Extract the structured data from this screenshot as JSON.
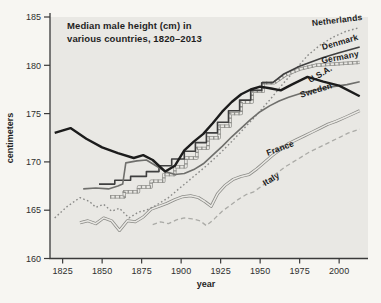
{
  "chart": {
    "title_line1": "Median male height (cm) in",
    "title_line2": "various countries, 1820–2013",
    "y_axis": {
      "label": "centimeters",
      "tick_labels": [
        "185",
        "180",
        "175",
        "170",
        "165",
        "160"
      ]
    },
    "x_axis": {
      "label": "year",
      "tick_labels": [
        "1825",
        "1850",
        "1875",
        "1900",
        "1925",
        "1950",
        "1975",
        "2000"
      ]
    }
  },
  "chart_data": {
    "type": "line",
    "title": "Median male height (cm) in various countries, 1820–2013",
    "xlabel": "year",
    "ylabel": "centimeters",
    "xlim": [
      1817,
      2017
    ],
    "ylim": [
      160,
      185
    ],
    "x_ticks": [
      1825,
      1850,
      1875,
      1900,
      1925,
      1950,
      1975,
      2000
    ],
    "y_ticks": [
      185,
      180,
      175,
      170,
      165,
      160
    ],
    "grid": false,
    "legend": "inline-labels-at-line-ends",
    "layout": {
      "x0": 50,
      "x1": 366,
      "y0": 258.5,
      "y1": 17,
      "xmin": 1817,
      "xmax": 2017,
      "ymin": 160,
      "ymax": 185
    },
    "colors": {
      "page_bg": "#f7f6f2",
      "plot_bg": "#e9e8e4",
      "axis": "#3a3a3a",
      "text": "#1f1f1f"
    },
    "series": [
      {
        "name": "italy",
        "label": "Italy",
        "line_style": "dashed",
        "color": "#ababa7",
        "points": [
          [
            1882,
            163.5
          ],
          [
            1887,
            163.8
          ],
          [
            1892,
            163.6
          ],
          [
            1897,
            164.0
          ],
          [
            1902,
            164.2
          ],
          [
            1907,
            164.1
          ],
          [
            1912,
            163.9
          ],
          [
            1916,
            163.4
          ],
          [
            1921,
            164.1
          ],
          [
            1926,
            164.9
          ],
          [
            1931,
            165.5
          ],
          [
            1936,
            166.1
          ],
          [
            1941,
            166.6
          ],
          [
            1946,
            166.9
          ],
          [
            1951,
            167.5
          ],
          [
            1956,
            168.2
          ],
          [
            1961,
            168.9
          ],
          [
            1966,
            169.5
          ],
          [
            1971,
            170.0
          ],
          [
            1976,
            170.5
          ],
          [
            1981,
            171.0
          ],
          [
            1986,
            171.4
          ],
          [
            1991,
            171.8
          ],
          [
            1996,
            172.2
          ],
          [
            2001,
            172.6
          ],
          [
            2006,
            173.0
          ],
          [
            2013,
            173.4
          ]
        ]
      },
      {
        "name": "france",
        "label": "France",
        "line_style": "double",
        "color": "#8a8a86",
        "points": [
          [
            1836,
            163.7
          ],
          [
            1841,
            163.9
          ],
          [
            1846,
            163.6
          ],
          [
            1851,
            164.2
          ],
          [
            1856,
            163.9
          ],
          [
            1861,
            162.9
          ],
          [
            1866,
            163.9
          ],
          [
            1871,
            163.8
          ],
          [
            1876,
            164.3
          ],
          [
            1881,
            165.1
          ],
          [
            1886,
            165.4
          ],
          [
            1891,
            165.7
          ],
          [
            1896,
            166.1
          ],
          [
            1901,
            166.4
          ],
          [
            1906,
            166.5
          ],
          [
            1911,
            166.3
          ],
          [
            1915,
            165.9
          ],
          [
            1919,
            165.4
          ],
          [
            1923,
            166.7
          ],
          [
            1928,
            167.6
          ],
          [
            1933,
            168.2
          ],
          [
            1938,
            168.5
          ],
          [
            1943,
            168.7
          ],
          [
            1948,
            169.3
          ],
          [
            1953,
            170.0
          ],
          [
            1958,
            170.7
          ],
          [
            1963,
            171.3
          ],
          [
            1968,
            171.9
          ],
          [
            1973,
            172.3
          ],
          [
            1978,
            172.7
          ],
          [
            1983,
            173.1
          ],
          [
            1988,
            173.5
          ],
          [
            1993,
            173.9
          ],
          [
            1998,
            174.2
          ],
          [
            2005,
            174.7
          ],
          [
            2013,
            175.3
          ]
        ]
      },
      {
        "name": "netherlands",
        "label": "Netherlands",
        "line_style": "dotted",
        "color": "#8a8a88",
        "points": [
          [
            1820,
            164.2
          ],
          [
            1828,
            165.4
          ],
          [
            1836,
            166.3
          ],
          [
            1842,
            165.9
          ],
          [
            1846,
            165.3
          ],
          [
            1851,
            165.6
          ],
          [
            1856,
            164.9
          ],
          [
            1861,
            165.2
          ],
          [
            1867,
            164.2
          ],
          [
            1873,
            164.8
          ],
          [
            1878,
            165.0
          ],
          [
            1884,
            165.5
          ],
          [
            1892,
            166.3
          ],
          [
            1900,
            167.4
          ],
          [
            1908,
            168.5
          ],
          [
            1916,
            169.6
          ],
          [
            1924,
            170.8
          ],
          [
            1932,
            172.1
          ],
          [
            1940,
            173.5
          ],
          [
            1948,
            174.9
          ],
          [
            1956,
            176.4
          ],
          [
            1964,
            178.0
          ],
          [
            1972,
            179.5
          ],
          [
            1980,
            181.0
          ],
          [
            1988,
            182.1
          ],
          [
            1996,
            182.9
          ],
          [
            2004,
            183.5
          ],
          [
            2013,
            183.9
          ]
        ]
      },
      {
        "name": "germany",
        "label": "Germany",
        "line_style": "railroad",
        "color": "#90908c",
        "points": [
          [
            1855,
            166.4
          ],
          [
            1864,
            166.4
          ],
          [
            1864,
            166.9
          ],
          [
            1873,
            166.9
          ],
          [
            1873,
            167.4
          ],
          [
            1881,
            167.4
          ],
          [
            1881,
            168.0
          ],
          [
            1889,
            168.0
          ],
          [
            1889,
            168.7
          ],
          [
            1896,
            168.7
          ],
          [
            1896,
            169.5
          ],
          [
            1903,
            169.5
          ],
          [
            1903,
            170.4
          ],
          [
            1910,
            170.4
          ],
          [
            1910,
            171.4
          ],
          [
            1917,
            171.4
          ],
          [
            1917,
            172.5
          ],
          [
            1924,
            172.5
          ],
          [
            1924,
            173.7
          ],
          [
            1931,
            173.7
          ],
          [
            1931,
            175.0
          ],
          [
            1938,
            175.0
          ],
          [
            1938,
            176.2
          ],
          [
            1945,
            176.2
          ],
          [
            1945,
            177.3
          ],
          [
            1952,
            177.3
          ],
          [
            1952,
            178.2
          ],
          [
            1959,
            178.2
          ],
          [
            1966,
            179.0
          ],
          [
            1975,
            179.6
          ],
          [
            1985,
            180.0
          ],
          [
            2013,
            180.3
          ]
        ]
      },
      {
        "name": "denmark",
        "label": "Denmark",
        "line_style": "solid",
        "color": "#3f3f3f",
        "points": [
          [
            1848,
            167.7
          ],
          [
            1858,
            167.7
          ],
          [
            1858,
            168.1
          ],
          [
            1868,
            168.1
          ],
          [
            1868,
            168.5
          ],
          [
            1878,
            168.5
          ],
          [
            1878,
            169.0
          ],
          [
            1886,
            169.0
          ],
          [
            1886,
            169.6
          ],
          [
            1894,
            169.6
          ],
          [
            1894,
            170.3
          ],
          [
            1902,
            170.3
          ],
          [
            1902,
            171.1
          ],
          [
            1909,
            171.1
          ],
          [
            1909,
            172.0
          ],
          [
            1916,
            172.0
          ],
          [
            1916,
            173.0
          ],
          [
            1923,
            173.0
          ],
          [
            1923,
            174.1
          ],
          [
            1930,
            174.1
          ],
          [
            1930,
            175.3
          ],
          [
            1937,
            175.3
          ],
          [
            1937,
            176.4
          ],
          [
            1944,
            176.4
          ],
          [
            1944,
            177.4
          ],
          [
            1951,
            177.4
          ],
          [
            1951,
            178.2
          ],
          [
            1958,
            178.2
          ],
          [
            1965,
            179.1
          ],
          [
            1975,
            179.9
          ],
          [
            1990,
            180.8
          ],
          [
            2000,
            181.3
          ],
          [
            2013,
            181.9
          ]
        ]
      },
      {
        "name": "sweden",
        "label": "Sweden",
        "line_style": "solid",
        "color": "#6f6f6c",
        "points": [
          [
            1838,
            167.2
          ],
          [
            1846,
            167.3
          ],
          [
            1854,
            167.2
          ],
          [
            1860,
            167.5
          ],
          [
            1863,
            167.7
          ],
          [
            1865,
            169.9
          ],
          [
            1872,
            170.1
          ],
          [
            1878,
            170.2
          ],
          [
            1884,
            169.6
          ],
          [
            1890,
            169.0
          ],
          [
            1896,
            168.7
          ],
          [
            1902,
            168.8
          ],
          [
            1908,
            169.2
          ],
          [
            1914,
            169.8
          ],
          [
            1920,
            170.7
          ],
          [
            1926,
            171.6
          ],
          [
            1932,
            172.6
          ],
          [
            1938,
            173.5
          ],
          [
            1944,
            174.4
          ],
          [
            1950,
            175.2
          ],
          [
            1956,
            175.8
          ],
          [
            1962,
            176.3
          ],
          [
            1968,
            176.7
          ],
          [
            1976,
            177.1
          ],
          [
            1986,
            177.5
          ],
          [
            1996,
            177.8
          ],
          [
            2005,
            178.0
          ],
          [
            2013,
            178.3
          ]
        ]
      },
      {
        "name": "usa",
        "label": "U.S.A.",
        "line_style": "thick",
        "color": "#1c1c1c",
        "points": [
          [
            1820,
            173.0
          ],
          [
            1830,
            173.5
          ],
          [
            1840,
            172.4
          ],
          [
            1850,
            171.5
          ],
          [
            1860,
            170.9
          ],
          [
            1870,
            170.4
          ],
          [
            1876,
            170.7
          ],
          [
            1882,
            170.2
          ],
          [
            1890,
            169.0
          ],
          [
            1896,
            169.6
          ],
          [
            1902,
            171.2
          ],
          [
            1908,
            172.1
          ],
          [
            1914,
            172.9
          ],
          [
            1920,
            174.0
          ],
          [
            1926,
            175.2
          ],
          [
            1932,
            176.2
          ],
          [
            1938,
            177.0
          ],
          [
            1944,
            177.5
          ],
          [
            1950,
            177.8
          ],
          [
            1957,
            177.6
          ],
          [
            1963,
            177.4
          ],
          [
            1970,
            178.0
          ],
          [
            1980,
            178.8
          ],
          [
            1990,
            178.3
          ],
          [
            2000,
            177.9
          ],
          [
            2013,
            176.8
          ]
        ]
      }
    ]
  }
}
